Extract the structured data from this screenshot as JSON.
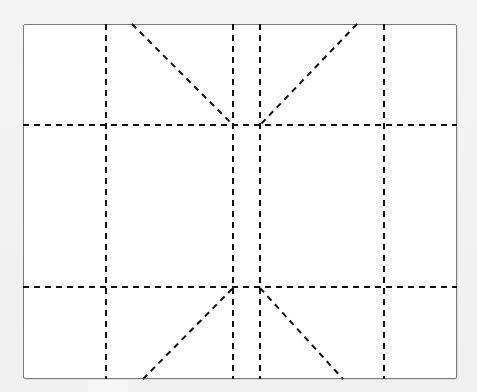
{
  "diagram": {
    "type": "paper-folding-pattern",
    "sheet": {
      "x": 23,
      "y": 24,
      "width": 434,
      "height": 355,
      "border_color": "#7a7a7a",
      "fill": "#ffffff"
    },
    "line_style": {
      "color": "#111111",
      "dash": "6 5",
      "width": 2
    },
    "fold_lines": {
      "vertical": [
        {
          "id": "v1",
          "x": 106,
          "y1": 24,
          "y2": 379
        },
        {
          "id": "v2",
          "x": 233,
          "y1": 24,
          "y2": 379
        },
        {
          "id": "v3",
          "x": 260,
          "y1": 24,
          "y2": 379
        },
        {
          "id": "v4",
          "x": 384,
          "y1": 24,
          "y2": 379
        }
      ],
      "horizontal": [
        {
          "id": "h1",
          "y": 125,
          "x1": 23,
          "x2": 457
        },
        {
          "id": "h2",
          "y": 287,
          "x1": 23,
          "x2": 457
        }
      ],
      "diagonal": [
        {
          "id": "d-top-left",
          "x1": 132,
          "y1": 24,
          "x2": 233,
          "y2": 125
        },
        {
          "id": "d-top-right",
          "x1": 357,
          "y1": 24,
          "x2": 260,
          "y2": 125
        },
        {
          "id": "d-bottom-left",
          "x1": 143,
          "y1": 379,
          "x2": 233,
          "y2": 288
        },
        {
          "id": "d-bottom-right",
          "x1": 260,
          "y1": 288,
          "x2": 343,
          "y2": 379
        }
      ]
    }
  }
}
